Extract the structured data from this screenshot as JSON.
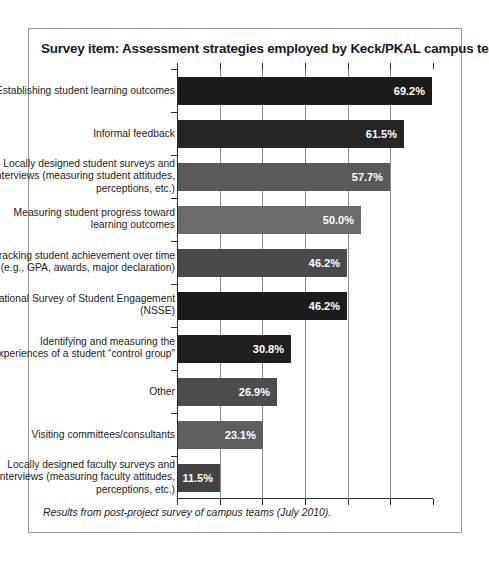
{
  "figure": {
    "title": "Survey item: Assessment strategies employed by Keck/PKAL campus teams",
    "footnote": "Results from post-project survey of campus teams (July 2010)."
  },
  "chart_data": {
    "type": "bar",
    "orientation": "horizontal",
    "title": "Survey item: Assessment strategies employed by Keck/PKAL campus teams",
    "xlabel": "",
    "ylabel": "",
    "xlim": [
      0,
      69.8
    ],
    "grid": true,
    "legend": null,
    "tick_labels": [],
    "value_suffix": "%",
    "categories": [
      "Establishing student learning outcomes",
      "Informal feedback",
      "Locally designed student surveys and interviews (measuring student attitudes, perceptions, etc.)",
      "Measuring student progress toward learning outcomes",
      "Tracking student achievement over time (e.g., GPA, awards, major declaration)",
      "National Survey of Student Engagement (NSSE)",
      "Identifying and measuring the experiences of a student “control group”",
      "Other",
      "Visiting committees/consultants",
      "Locally designed faculty surveys and interviews (measuring faculty attitudes, perceptions, etc.)"
    ],
    "values": [
      69.2,
      61.5,
      57.7,
      50.0,
      46.2,
      46.2,
      30.8,
      26.9,
      23.1,
      11.5
    ],
    "value_labels": [
      "69.2%",
      "61.5%",
      "57.7%",
      "50.0%",
      "46.2%",
      "46.2%",
      "30.8%",
      "26.9%",
      "23.1%",
      "11.5%"
    ],
    "bar_colors": [
      "#1c1c1c",
      "#262626",
      "#595959",
      "#6b6b6b",
      "#4a4a4a",
      "#1c1c1c",
      "#1f1f1f",
      "#4d4d4d",
      "#5f5f5f",
      "#434343"
    ]
  },
  "style": {
    "frame_border": "#9a9a9a",
    "axis_color": "#2b2b2b",
    "grid_color": "#8d8d8d",
    "label_color": "#232323",
    "value_text_color": "#ffffff"
  }
}
